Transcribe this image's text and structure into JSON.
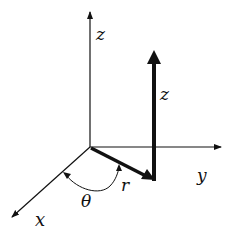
{
  "diagram": {
    "colors": {
      "stroke": "#111111",
      "background": "#ffffff"
    },
    "axes": [
      {
        "id": "z-axis",
        "label": "z"
      },
      {
        "id": "y-axis",
        "label": "y"
      },
      {
        "id": "x-axis",
        "label": "x"
      }
    ],
    "vectors": [
      {
        "id": "r-vector",
        "label": "r"
      },
      {
        "id": "z-vector",
        "label": "z"
      }
    ],
    "angle": {
      "id": "theta-arc",
      "label": "θ"
    }
  }
}
